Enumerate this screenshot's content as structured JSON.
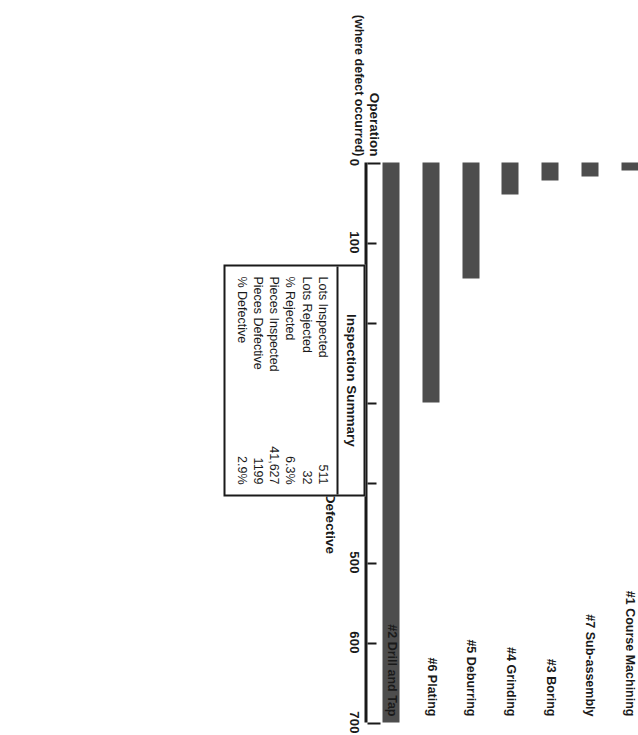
{
  "chart_data": {
    "type": "bar",
    "orientation": "vertical-bars-on-rotated-page",
    "title": "",
    "categories": [
      "#2 Drill and Tap",
      "#6 Plating",
      "#5 Deburring",
      "#4 Grinding",
      "#3 Boring",
      "#7 Sub-assembly",
      "#1 Course Machining"
    ],
    "values": [
      700,
      300,
      145,
      40,
      22,
      17,
      10
    ],
    "xlabel": "Operation",
    "xlabel_sub": "(where defect occurred)",
    "ylabel": "Number of Pieces Found Defective",
    "ylim": [
      0,
      700
    ],
    "yticks": [
      0,
      100,
      200,
      300,
      400,
      500,
      600,
      700
    ],
    "ytick_labels": [
      "0",
      "100",
      "200",
      "300",
      "400",
      "500",
      "600",
      "700"
    ],
    "grid": false,
    "legend": false,
    "bar_color": "#4d4d4d",
    "axis_color": "#1a1a1a"
  },
  "summary": {
    "title": "Inspection Summary",
    "rows": [
      {
        "label": "Lots Inspected",
        "value": "511"
      },
      {
        "label": "Lots Rejected",
        "value": "32"
      },
      {
        "label": "% Rejected",
        "value": "6.3%"
      },
      {
        "label": "Pieces Inspected",
        "value": "41,627"
      },
      {
        "label": "Pieces Defective",
        "value": "1199"
      },
      {
        "label": "% Defective",
        "value": "2.9%"
      }
    ]
  }
}
